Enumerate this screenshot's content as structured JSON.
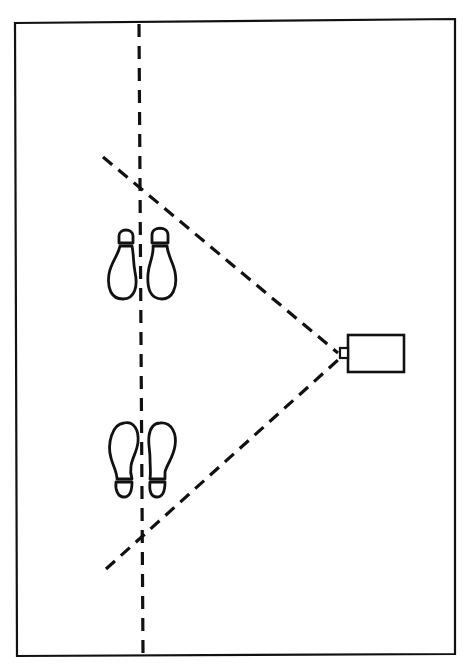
{
  "diagram": {
    "colors": {
      "ink": "#111111",
      "paper": "#ffffff"
    },
    "elements": {
      "frame": "page-border",
      "center_line": "vertical-dashed-line",
      "fov_upper": "upper-field-of-view-line",
      "fov_lower": "lower-field-of-view-line",
      "camera": "camera-icon",
      "footprints_upper": "footprints-heels-up",
      "footprints_lower": "footprints-toes-up"
    }
  }
}
